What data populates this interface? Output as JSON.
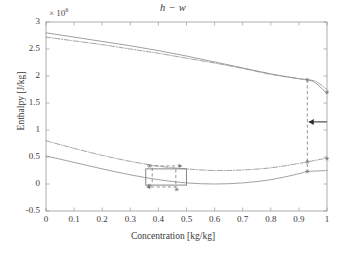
{
  "chart_data": {
    "type": "line",
    "title": "h − w",
    "xlabel": "Concentration [kg/kg]",
    "ylabel": "Enthalpy [J/kg]",
    "exponent_label": "× 10",
    "exponent_power": "6",
    "y_scale_factor": 1000000,
    "xlim": [
      0,
      1
    ],
    "ylim": [
      -0.5,
      3
    ],
    "xticks": [
      "0",
      "0.1",
      "0.2",
      "0.3",
      "0.4",
      "0.5",
      "0.6",
      "0.7",
      "0.8",
      "0.9",
      "1"
    ],
    "xtick_values": [
      0,
      0.1,
      0.2,
      0.3,
      0.4,
      0.5,
      0.6,
      0.7,
      0.8,
      0.9,
      1
    ],
    "yticks": [
      "3",
      "2.5",
      "2",
      "1.5",
      "1",
      "0.5",
      "0",
      "-0.5"
    ],
    "ytick_values": [
      3,
      2.5,
      2,
      1.5,
      1,
      0.5,
      0,
      -0.5
    ],
    "grid": false,
    "legend": "none",
    "series": [
      {
        "name": "vapour-enthalpy-solid",
        "style": "solid",
        "color": "#8f8f8f",
        "x": [
          0,
          0.1,
          0.2,
          0.3,
          0.4,
          0.5,
          0.6,
          0.7,
          0.8,
          0.9,
          0.93,
          0.96,
          1
        ],
        "y": [
          2.8,
          2.72,
          2.64,
          2.56,
          2.47,
          2.37,
          2.26,
          2.15,
          2.04,
          1.95,
          1.93,
          1.87,
          1.67
        ]
      },
      {
        "name": "vapour-enthalpy-dashdot",
        "style": "dashdot",
        "color": "#8f8f8f",
        "x": [
          0,
          0.1,
          0.2,
          0.3,
          0.4,
          0.5,
          0.6,
          0.7,
          0.8,
          0.9,
          0.93,
          0.96,
          1
        ],
        "y": [
          2.72,
          2.65,
          2.58,
          2.5,
          2.42,
          2.33,
          2.24,
          2.14,
          2.03,
          1.95,
          1.93,
          1.9,
          1.75
        ]
      },
      {
        "name": "liquid-enthalpy-dashdot",
        "style": "dashdot",
        "color": "#8f8f8f",
        "x": [
          0,
          0.1,
          0.2,
          0.3,
          0.4,
          0.5,
          0.6,
          0.7,
          0.8,
          0.9,
          0.93,
          1
        ],
        "y": [
          0.8,
          0.66,
          0.53,
          0.42,
          0.33,
          0.28,
          0.25,
          0.26,
          0.3,
          0.38,
          0.41,
          0.48
        ]
      },
      {
        "name": "liquid-enthalpy-solid",
        "style": "solid",
        "color": "#8f8f8f",
        "x": [
          0,
          0.1,
          0.2,
          0.3,
          0.4,
          0.5,
          0.6,
          0.7,
          0.8,
          0.9,
          0.93,
          1
        ],
        "y": [
          0.52,
          0.4,
          0.28,
          0.17,
          0.08,
          0.02,
          0.0,
          0.02,
          0.08,
          0.19,
          0.23,
          0.25
        ]
      }
    ],
    "markers": [
      {
        "name": "marker-upper-093",
        "x": 0.93,
        "y": 1.93
      },
      {
        "name": "marker-lower-dashdot-093",
        "x": 0.93,
        "y": 0.41
      },
      {
        "name": "marker-lower-solid-093",
        "x": 0.93,
        "y": 0.23
      },
      {
        "name": "marker-box-top-left",
        "x": 0.368,
        "y": 0.335
      },
      {
        "name": "marker-box-bottom-left",
        "x": 0.368,
        "y": -0.03
      },
      {
        "name": "marker-box-bottom-mid",
        "x": 0.465,
        "y": -0.1
      },
      {
        "name": "marker-right-edge-upper",
        "x": 1.0,
        "y": 1.7
      },
      {
        "name": "marker-right-edge-lower",
        "x": 1.0,
        "y": 0.47
      }
    ],
    "annotations": [
      {
        "name": "vertical-connector-line",
        "type": "dashed-vline",
        "x": 0.93,
        "y_from": 1.93,
        "y_to": 0.23
      },
      {
        "name": "left-pointing-arrow",
        "type": "arrow",
        "x_from": 1.0,
        "x_to": 0.935,
        "y": 1.15,
        "direction": "left"
      },
      {
        "name": "process-box",
        "type": "rectangle",
        "x_from": 0.355,
        "x_to": 0.5,
        "y_from": -0.02,
        "y_to": 0.28
      },
      {
        "name": "box-arrow-top-right",
        "type": "dashed-arrow",
        "x_from": 0.368,
        "x_to": 0.485,
        "y": 0.335,
        "direction": "right"
      },
      {
        "name": "box-arrow-bottom-left",
        "type": "dashed-arrow",
        "x_from": 0.465,
        "x_to": 0.358,
        "y": -0.055,
        "direction": "left"
      },
      {
        "name": "box-inner-vline-left",
        "type": "dashed-vline",
        "x": 0.378,
        "y_from": 0.3,
        "y_to": 0.02
      },
      {
        "name": "box-inner-vline-right",
        "type": "dashed-vline",
        "x": 0.462,
        "y_from": 0.27,
        "y_to": -0.06
      }
    ],
    "colors": {
      "curve": "#8f8f8f",
      "axis": "#9a9a9a",
      "text": "#3a3a3a",
      "annotation": "#7a7a7a",
      "arrow": "#2a2a2a",
      "background": "#ffffff"
    }
  }
}
